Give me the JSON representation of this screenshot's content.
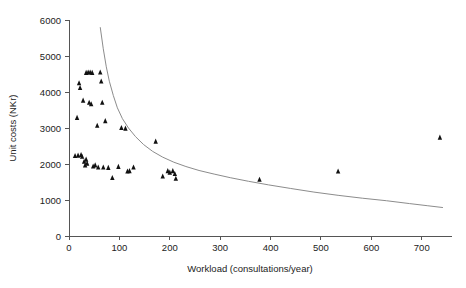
{
  "chart_data": {
    "type": "scatter",
    "title": "",
    "xlabel": "Workload (consultations/year)",
    "ylabel": "Unit costs (NKr)",
    "xlim": [
      0,
      760
    ],
    "ylim": [
      0,
      6000
    ],
    "xticks": [
      0,
      100,
      200,
      300,
      400,
      500,
      600,
      700
    ],
    "yticks": [
      0,
      1000,
      2000,
      3000,
      4000,
      5000,
      6000
    ],
    "xticklabels": [
      "0",
      "100",
      "200",
      "300",
      "400",
      "500",
      "600",
      "700"
    ],
    "yticklabels": [
      "0",
      "1000",
      "2000",
      "3000",
      "4000",
      "5000",
      "6000"
    ],
    "grid": false,
    "legend": "none",
    "marker_style": "filled-triangle",
    "marker_color": "#111111",
    "curve_color": "#8c8c8c",
    "axis_color": "#555555",
    "series": [
      {
        "name": "Observed practices",
        "type": "scatter",
        "points": [
          [
            12,
            2220
          ],
          [
            16,
            3280
          ],
          [
            18,
            2230
          ],
          [
            20,
            4240
          ],
          [
            22,
            4110
          ],
          [
            24,
            2250
          ],
          [
            26,
            2200
          ],
          [
            28,
            3760
          ],
          [
            30,
            2060
          ],
          [
            32,
            1960
          ],
          [
            34,
            4530
          ],
          [
            38,
            4540
          ],
          [
            42,
            4540
          ],
          [
            46,
            4530
          ],
          [
            34,
            2120
          ],
          [
            36,
            2010
          ],
          [
            40,
            3700
          ],
          [
            44,
            3660
          ],
          [
            48,
            1930
          ],
          [
            52,
            1960
          ],
          [
            56,
            3060
          ],
          [
            58,
            1900
          ],
          [
            62,
            4540
          ],
          [
            64,
            4290
          ],
          [
            66,
            3700
          ],
          [
            68,
            1900
          ],
          [
            72,
            3190
          ],
          [
            78,
            1890
          ],
          [
            86,
            1610
          ],
          [
            98,
            1920
          ],
          [
            104,
            3000
          ],
          [
            112,
            2980
          ],
          [
            116,
            1790
          ],
          [
            120,
            1800
          ],
          [
            128,
            1900
          ],
          [
            172,
            2620
          ],
          [
            186,
            1650
          ],
          [
            196,
            1800
          ],
          [
            200,
            1760
          ],
          [
            206,
            1800
          ],
          [
            210,
            1720
          ],
          [
            212,
            1590
          ],
          [
            378,
            1560
          ],
          [
            534,
            1790
          ],
          [
            736,
            2730
          ]
        ]
      },
      {
        "name": "Fitted average cost curve",
        "type": "line",
        "points": [
          [
            62,
            5800
          ],
          [
            68,
            5200
          ],
          [
            74,
            4700
          ],
          [
            80,
            4300
          ],
          [
            88,
            3900
          ],
          [
            96,
            3560
          ],
          [
            106,
            3260
          ],
          [
            118,
            3000
          ],
          [
            132,
            2760
          ],
          [
            148,
            2540
          ],
          [
            166,
            2350
          ],
          [
            186,
            2190
          ],
          [
            208,
            2050
          ],
          [
            232,
            1930
          ],
          [
            258,
            1820
          ],
          [
            288,
            1720
          ],
          [
            320,
            1620
          ],
          [
            356,
            1520
          ],
          [
            396,
            1420
          ],
          [
            440,
            1320
          ],
          [
            486,
            1220
          ],
          [
            534,
            1130
          ],
          [
            582,
            1050
          ],
          [
            630,
            980
          ],
          [
            676,
            900
          ],
          [
            712,
            840
          ],
          [
            742,
            790
          ]
        ]
      }
    ]
  },
  "axes": {
    "x_title": "Workload (consultations/year)",
    "y_title": "Unit costs (NKr)"
  }
}
